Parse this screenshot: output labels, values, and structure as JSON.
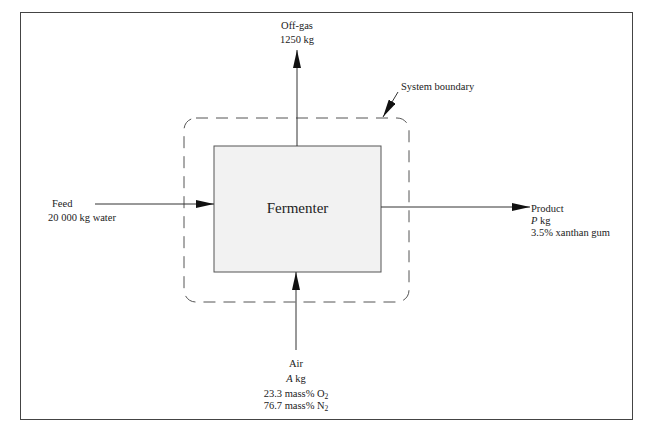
{
  "diagram": {
    "unit": {
      "label": "Fermenter"
    },
    "boundary": {
      "label": "System boundary"
    },
    "streams": {
      "offgas": {
        "name": "Off-gas",
        "amount": "1250 kg"
      },
      "feed": {
        "name": "Feed",
        "amount": "20 000 kg water"
      },
      "product": {
        "name": "Product",
        "var": "P",
        "unit": " kg",
        "composition": "3.5% xanthan gum"
      },
      "air": {
        "name": "Air",
        "var": "A",
        "unit": " kg",
        "o2_value": "23.3 mass% O",
        "o2_sub": "2",
        "n2_value": "76.7 mass% N",
        "n2_sub": "2"
      }
    },
    "colors": {
      "unit_fill": "#f2f2f2",
      "line": "#333333",
      "boundary": "#555555"
    }
  }
}
